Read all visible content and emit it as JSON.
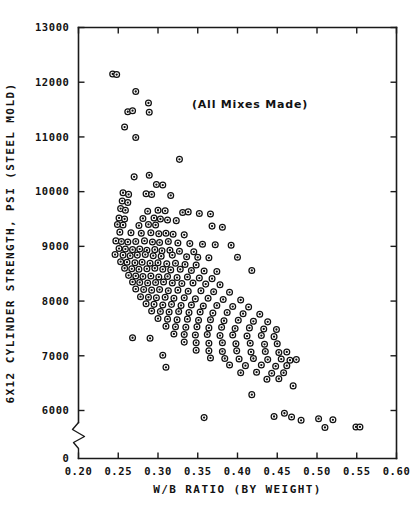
{
  "chart_data": {
    "type": "scatter",
    "title": "",
    "annotation": "(All Mixes Made)",
    "xlabel": "W/B RATIO (BY WEIGHT)",
    "ylabel": "6X12 CYLINDER STRENGTH, PSI (STEEL MOLD)",
    "xlim": [
      0.2,
      0.6
    ],
    "ylim": [
      5500,
      13000
    ],
    "xticks": [
      0.2,
      0.25,
      0.3,
      0.35,
      0.4,
      0.45,
      0.5,
      0.55,
      0.6
    ],
    "xtick_labels": [
      "0.20",
      "0.25",
      "0.30",
      "0.35",
      "0.40",
      "0.45",
      "0.50",
      "0.55",
      "0.60"
    ],
    "yticks": [
      6000,
      7000,
      8000,
      9000,
      10000,
      11000,
      12000,
      13000
    ],
    "ytick_labels": [
      "6000",
      "7000",
      "8000",
      "9000",
      "10000",
      "11000",
      "12000",
      "13000"
    ],
    "origin_label": "0",
    "grid": false,
    "legend": null,
    "axis_break": {
      "axis": "y",
      "note": "zigzag break between 0 and 6000"
    },
    "marker": {
      "shape": "circle-with-center-dot",
      "size_px": 6,
      "edge_color": "#111111",
      "face_color": "#ffffff"
    },
    "n_points": 232,
    "points": [
      [
        0.243,
        12150
      ],
      [
        0.248,
        12140
      ],
      [
        0.272,
        11830
      ],
      [
        0.288,
        11620
      ],
      [
        0.262,
        11460
      ],
      [
        0.268,
        11480
      ],
      [
        0.289,
        11450
      ],
      [
        0.258,
        11180
      ],
      [
        0.272,
        10990
      ],
      [
        0.327,
        10590
      ],
      [
        0.27,
        10270
      ],
      [
        0.289,
        10300
      ],
      [
        0.298,
        10130
      ],
      [
        0.306,
        10120
      ],
      [
        0.256,
        9980
      ],
      [
        0.263,
        9950
      ],
      [
        0.316,
        9930
      ],
      [
        0.285,
        9960
      ],
      [
        0.292,
        9950
      ],
      [
        0.255,
        9830
      ],
      [
        0.262,
        9800
      ],
      [
        0.253,
        9690
      ],
      [
        0.259,
        9660
      ],
      [
        0.287,
        9640
      ],
      [
        0.3,
        9660
      ],
      [
        0.309,
        9650
      ],
      [
        0.331,
        9620
      ],
      [
        0.338,
        9630
      ],
      [
        0.352,
        9600
      ],
      [
        0.366,
        9590
      ],
      [
        0.251,
        9520
      ],
      [
        0.258,
        9500
      ],
      [
        0.281,
        9510
      ],
      [
        0.295,
        9520
      ],
      [
        0.303,
        9500
      ],
      [
        0.312,
        9480
      ],
      [
        0.323,
        9470
      ],
      [
        0.249,
        9400
      ],
      [
        0.256,
        9390
      ],
      [
        0.276,
        9380
      ],
      [
        0.288,
        9400
      ],
      [
        0.297,
        9390
      ],
      [
        0.368,
        9370
      ],
      [
        0.381,
        9350
      ],
      [
        0.252,
        9260
      ],
      [
        0.266,
        9250
      ],
      [
        0.279,
        9240
      ],
      [
        0.291,
        9250
      ],
      [
        0.301,
        9230
      ],
      [
        0.31,
        9240
      ],
      [
        0.319,
        9220
      ],
      [
        0.333,
        9210
      ],
      [
        0.247,
        9100
      ],
      [
        0.254,
        9090
      ],
      [
        0.262,
        9080
      ],
      [
        0.272,
        9090
      ],
      [
        0.283,
        9100
      ],
      [
        0.293,
        9080
      ],
      [
        0.302,
        9070
      ],
      [
        0.313,
        9090
      ],
      [
        0.325,
        9060
      ],
      [
        0.34,
        9050
      ],
      [
        0.356,
        9040
      ],
      [
        0.372,
        9030
      ],
      [
        0.392,
        9020
      ],
      [
        0.251,
        8960
      ],
      [
        0.259,
        8950
      ],
      [
        0.268,
        8940
      ],
      [
        0.277,
        8950
      ],
      [
        0.286,
        8930
      ],
      [
        0.296,
        8940
      ],
      [
        0.305,
        8920
      ],
      [
        0.315,
        8930
      ],
      [
        0.327,
        8910
      ],
      [
        0.345,
        8900
      ],
      [
        0.246,
        8850
      ],
      [
        0.256,
        8840
      ],
      [
        0.265,
        8830
      ],
      [
        0.274,
        8840
      ],
      [
        0.284,
        8850
      ],
      [
        0.294,
        8830
      ],
      [
        0.304,
        8820
      ],
      [
        0.318,
        8840
      ],
      [
        0.336,
        8810
      ],
      [
        0.35,
        8800
      ],
      [
        0.364,
        8790
      ],
      [
        0.4,
        8800
      ],
      [
        0.253,
        8720
      ],
      [
        0.261,
        8710
      ],
      [
        0.271,
        8700
      ],
      [
        0.28,
        8710
      ],
      [
        0.29,
        8690
      ],
      [
        0.3,
        8700
      ],
      [
        0.311,
        8680
      ],
      [
        0.322,
        8690
      ],
      [
        0.334,
        8670
      ],
      [
        0.348,
        8660
      ],
      [
        0.258,
        8600
      ],
      [
        0.267,
        8590
      ],
      [
        0.276,
        8580
      ],
      [
        0.286,
        8590
      ],
      [
        0.296,
        8600
      ],
      [
        0.306,
        8580
      ],
      [
        0.316,
        8570
      ],
      [
        0.328,
        8580
      ],
      [
        0.342,
        8560
      ],
      [
        0.358,
        8550
      ],
      [
        0.374,
        8540
      ],
      [
        0.418,
        8560
      ],
      [
        0.263,
        8470
      ],
      [
        0.272,
        8460
      ],
      [
        0.281,
        8450
      ],
      [
        0.291,
        8460
      ],
      [
        0.301,
        8440
      ],
      [
        0.312,
        8450
      ],
      [
        0.324,
        8430
      ],
      [
        0.337,
        8440
      ],
      [
        0.352,
        8420
      ],
      [
        0.368,
        8410
      ],
      [
        0.268,
        8350
      ],
      [
        0.277,
        8340
      ],
      [
        0.287,
        8330
      ],
      [
        0.297,
        8340
      ],
      [
        0.307,
        8350
      ],
      [
        0.318,
        8330
      ],
      [
        0.33,
        8320
      ],
      [
        0.344,
        8330
      ],
      [
        0.36,
        8310
      ],
      [
        0.378,
        8300
      ],
      [
        0.272,
        8220
      ],
      [
        0.282,
        8210
      ],
      [
        0.292,
        8200
      ],
      [
        0.302,
        8210
      ],
      [
        0.313,
        8190
      ],
      [
        0.325,
        8200
      ],
      [
        0.338,
        8180
      ],
      [
        0.354,
        8190
      ],
      [
        0.37,
        8170
      ],
      [
        0.39,
        8160
      ],
      [
        0.278,
        8080
      ],
      [
        0.288,
        8070
      ],
      [
        0.298,
        8060
      ],
      [
        0.309,
        8070
      ],
      [
        0.32,
        8050
      ],
      [
        0.333,
        8060
      ],
      [
        0.347,
        8040
      ],
      [
        0.363,
        8050
      ],
      [
        0.382,
        8030
      ],
      [
        0.404,
        8020
      ],
      [
        0.285,
        7950
      ],
      [
        0.295,
        7940
      ],
      [
        0.306,
        7930
      ],
      [
        0.317,
        7940
      ],
      [
        0.329,
        7920
      ],
      [
        0.342,
        7930
      ],
      [
        0.357,
        7910
      ],
      [
        0.374,
        7920
      ],
      [
        0.394,
        7900
      ],
      [
        0.414,
        7890
      ],
      [
        0.292,
        7820
      ],
      [
        0.303,
        7810
      ],
      [
        0.314,
        7800
      ],
      [
        0.326,
        7810
      ],
      [
        0.339,
        7790
      ],
      [
        0.353,
        7800
      ],
      [
        0.369,
        7780
      ],
      [
        0.387,
        7790
      ],
      [
        0.407,
        7770
      ],
      [
        0.428,
        7760
      ],
      [
        0.3,
        7680
      ],
      [
        0.312,
        7670
      ],
      [
        0.324,
        7660
      ],
      [
        0.337,
        7670
      ],
      [
        0.351,
        7650
      ],
      [
        0.366,
        7660
      ],
      [
        0.383,
        7640
      ],
      [
        0.401,
        7650
      ],
      [
        0.42,
        7630
      ],
      [
        0.438,
        7620
      ],
      [
        0.31,
        7540
      ],
      [
        0.322,
        7530
      ],
      [
        0.335,
        7520
      ],
      [
        0.349,
        7530
      ],
      [
        0.364,
        7510
      ],
      [
        0.38,
        7520
      ],
      [
        0.397,
        7500
      ],
      [
        0.415,
        7510
      ],
      [
        0.433,
        7490
      ],
      [
        0.449,
        7480
      ],
      [
        0.32,
        7400
      ],
      [
        0.333,
        7390
      ],
      [
        0.347,
        7380
      ],
      [
        0.362,
        7390
      ],
      [
        0.378,
        7370
      ],
      [
        0.394,
        7380
      ],
      [
        0.412,
        7360
      ],
      [
        0.43,
        7370
      ],
      [
        0.446,
        7350
      ],
      [
        0.268,
        7330
      ],
      [
        0.29,
        7320
      ],
      [
        0.333,
        7250
      ],
      [
        0.348,
        7240
      ],
      [
        0.364,
        7230
      ],
      [
        0.381,
        7240
      ],
      [
        0.398,
        7220
      ],
      [
        0.416,
        7230
      ],
      [
        0.434,
        7210
      ],
      [
        0.45,
        7220
      ],
      [
        0.348,
        7100
      ],
      [
        0.364,
        7090
      ],
      [
        0.381,
        7080
      ],
      [
        0.399,
        7090
      ],
      [
        0.417,
        7070
      ],
      [
        0.435,
        7080
      ],
      [
        0.452,
        7060
      ],
      [
        0.462,
        7070
      ],
      [
        0.306,
        7010
      ],
      [
        0.366,
        6960
      ],
      [
        0.384,
        6950
      ],
      [
        0.402,
        6940
      ],
      [
        0.42,
        6950
      ],
      [
        0.438,
        6930
      ],
      [
        0.455,
        6940
      ],
      [
        0.466,
        6920
      ],
      [
        0.474,
        6930
      ],
      [
        0.39,
        6830
      ],
      [
        0.41,
        6820
      ],
      [
        0.43,
        6830
      ],
      [
        0.448,
        6810
      ],
      [
        0.462,
        6820
      ],
      [
        0.31,
        6790
      ],
      [
        0.404,
        6690
      ],
      [
        0.424,
        6700
      ],
      [
        0.443,
        6680
      ],
      [
        0.458,
        6690
      ],
      [
        0.437,
        6570
      ],
      [
        0.452,
        6580
      ],
      [
        0.47,
        6450
      ],
      [
        0.418,
        6290
      ],
      [
        0.358,
        5870
      ],
      [
        0.446,
        5890
      ],
      [
        0.459,
        5950
      ],
      [
        0.468,
        5880
      ],
      [
        0.48,
        5820
      ],
      [
        0.502,
        5850
      ],
      [
        0.52,
        5830
      ],
      [
        0.549,
        5700
      ],
      [
        0.554,
        5700
      ],
      [
        0.51,
        5690
      ]
    ]
  }
}
